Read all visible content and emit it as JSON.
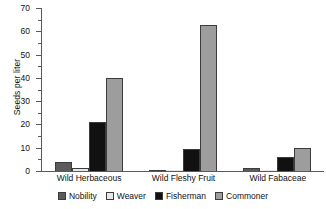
{
  "chart_data": {
    "type": "bar",
    "title": "",
    "xlabel": "",
    "ylabel": "Seeds per liter",
    "ylim": [
      0,
      70
    ],
    "ytick_step": 10,
    "yminor_step": 5,
    "grid": false,
    "legend_position": "bottom",
    "categories": [
      "Wild Herbaceous",
      "Wild Fleshy Fruit",
      "Wild Fabaceae"
    ],
    "yticks": [
      "0",
      "10",
      "20",
      "30",
      "40",
      "50",
      "60",
      "70"
    ],
    "series": [
      {
        "name": "Nobility",
        "color": "#5b5b5b",
        "values": [
          4,
          0.6,
          1.2
        ]
      },
      {
        "name": "Weaver",
        "color": "#e8e8e8",
        "values": [
          1.5,
          0.3,
          0.2
        ]
      },
      {
        "name": "Fisherman",
        "color": "#111111",
        "values": [
          21,
          9.5,
          6
        ]
      },
      {
        "name": "Commoner",
        "color": "#9d9d9d",
        "values": [
          40,
          62.8,
          10
        ]
      }
    ]
  },
  "legend": {
    "items": [
      {
        "label": "Nobility"
      },
      {
        "label": "Weaver"
      },
      {
        "label": "Fisherman"
      },
      {
        "label": "Commoner"
      }
    ]
  }
}
